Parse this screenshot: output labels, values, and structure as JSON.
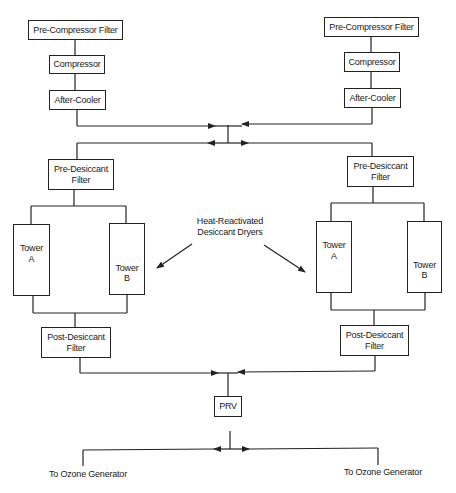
{
  "diagram": {
    "left_train": {
      "pre_compressor_filter": "Pre-Compressor Filter",
      "compressor": "Compressor",
      "after_cooler": "After-Cooler",
      "pre_desiccant_filter": "Pre-Desiccant\nFilter",
      "tower_a": "Tower\nA",
      "tower_b": "Tower\nB",
      "post_desiccant_filter": "Post-Desiccant\nFilter"
    },
    "right_train": {
      "pre_compressor_filter": "Pre-Compressor Filter",
      "compressor": "Compressor",
      "after_cooler": "After-Cooler",
      "pre_desiccant_filter": "Pre-Desiccant\nFilter",
      "tower_a": "Tower\nA",
      "tower_b": "Tower\nB",
      "post_desiccant_filter": "Post-Desiccant\nFilter"
    },
    "callout": "Heat-Reactivated\nDesiccant Dryers",
    "prv": "PRV",
    "outputs": {
      "left": "To Ozone Generator",
      "right": "To Ozone Generator"
    },
    "line_color": "#222222"
  }
}
